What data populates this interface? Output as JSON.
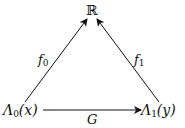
{
  "diagram": {
    "type": "commutative-triangle",
    "nodes": {
      "top": {
        "label": "ℝ"
      },
      "left": {
        "symbol": "Λ",
        "sub": "0",
        "arg": "(x)"
      },
      "right": {
        "symbol": "Λ",
        "sub": "1",
        "arg": "(y)"
      }
    },
    "edges": {
      "left_up": {
        "symbol": "f",
        "sub": "0",
        "from": "left",
        "to": "top"
      },
      "right_up": {
        "symbol": "f",
        "sub": "1",
        "from": "right",
        "to": "top"
      },
      "bottom": {
        "symbol": "G",
        "from": "left",
        "to": "right"
      }
    },
    "colors": {
      "ink": "#111111",
      "background": "#ffffff"
    }
  }
}
